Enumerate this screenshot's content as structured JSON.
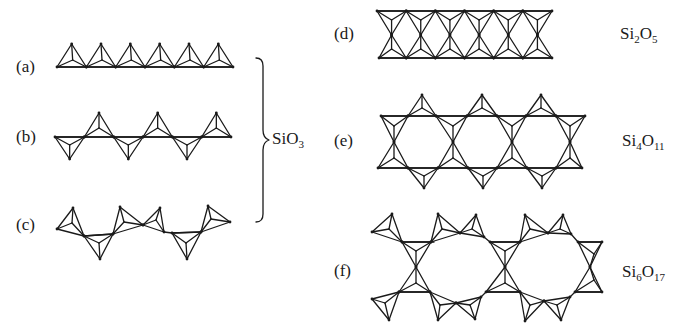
{
  "labels": {
    "a": "(a)",
    "b": "(b)",
    "c": "(c)",
    "d": "(d)",
    "e": "(e)",
    "f": "(f)"
  },
  "formulas": {
    "sio3": {
      "el1": "Si",
      "el2": "O",
      "sub1": "",
      "sub2": "3"
    },
    "si2o5": {
      "el1": "Si",
      "sub1": "2",
      "el2": "O",
      "sub2": "5"
    },
    "si4o11": {
      "el1": "Si",
      "sub1": "4",
      "el2": "O",
      "sub2": "11"
    },
    "si6o17": {
      "el1": "Si",
      "sub1": "6",
      "el2": "O",
      "sub2": "17"
    }
  },
  "structures": [
    {
      "id": "a",
      "description": "single chain of corner-sharing SiO4 tetrahedra, all pointing up",
      "tetrahedra": 6
    },
    {
      "id": "b",
      "description": "single chain, alternating up/down tetrahedra",
      "tetrahedra": 6
    },
    {
      "id": "c",
      "description": "single chain, twisted/zig-zag repeat",
      "tetrahedra": 6
    },
    {
      "id": "d",
      "description": "double-layer sheet",
      "formula": "Si2O5"
    },
    {
      "id": "e",
      "description": "double chain (amphibole type)",
      "formula": "Si4O11"
    },
    {
      "id": "f",
      "description": "double chain with larger rings",
      "formula": "Si6O17"
    }
  ],
  "group_brace": {
    "groups": [
      "a",
      "b",
      "c"
    ],
    "formula": "SiO3"
  },
  "colors": {
    "ink": "#1a1a1a",
    "background": "#ffffff"
  }
}
